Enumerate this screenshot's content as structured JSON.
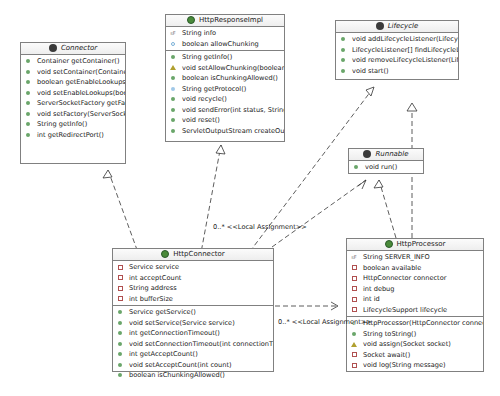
{
  "classes": {
    "connector": {
      "name": "Connector",
      "kind": "interface",
      "fields": [],
      "methods": [
        {
          "vis": "pub",
          "text": "Container getContainer()"
        },
        {
          "vis": "pub",
          "text": "void setContainer(Container co..."
        },
        {
          "vis": "pub",
          "text": "boolean getEnableLookups()"
        },
        {
          "vis": "pub",
          "text": "void setEnableLookups(boolean..."
        },
        {
          "vis": "pub",
          "text": "ServerSocketFactory getFactory()"
        },
        {
          "vis": "pub",
          "text": "void setFactory(ServerSocketF..."
        },
        {
          "vis": "pub",
          "text": "String getInfo()"
        },
        {
          "vis": "pub",
          "text": "int getRedirectPort()"
        }
      ]
    },
    "httpResponseImpl": {
      "name": "HttpResponseImpl",
      "kind": "class",
      "fields": [
        {
          "vis": "const",
          "text": "String info"
        },
        {
          "vis": "pkgfield",
          "text": "boolean allowChunking"
        }
      ],
      "methods": [
        {
          "vis": "pub",
          "text": "String getInfo()"
        },
        {
          "vis": "prot",
          "text": "void setAllowChunking(boolean allowChun..."
        },
        {
          "vis": "pub",
          "text": "boolean isChunkingAllowed()"
        },
        {
          "vis": "pkg",
          "text": "String getProtocol()"
        },
        {
          "vis": "pub",
          "text": "void recycle()"
        },
        {
          "vis": "pub",
          "text": "void sendError(int status, String message)"
        },
        {
          "vis": "pub",
          "text": "void reset()"
        },
        {
          "vis": "pub",
          "text": "ServletOutputStream createOutputStream()"
        }
      ]
    },
    "lifecycle": {
      "name": "Lifecycle",
      "kind": "interface",
      "fields": [],
      "methods": [
        {
          "vis": "pub",
          "text": "void addLifecycleListener(LifecycleListen..."
        },
        {
          "vis": "pub",
          "text": "LifecycleListener[] findLifecycleListeners()"
        },
        {
          "vis": "pub",
          "text": "void removeLifecycleListener(LifecycleLi..."
        },
        {
          "vis": "pub",
          "text": "void start()"
        }
      ]
    },
    "runnable": {
      "name": "Runnable",
      "kind": "interface",
      "fields": [],
      "methods": [
        {
          "vis": "pub",
          "text": "void run()"
        }
      ]
    },
    "httpConnector": {
      "name": "HttpConnector",
      "kind": "class",
      "fields": [
        {
          "vis": "priv",
          "text": "Service service"
        },
        {
          "vis": "priv",
          "text": "int acceptCount"
        },
        {
          "vis": "priv",
          "text": "String address"
        },
        {
          "vis": "priv",
          "text": "int bufferSize"
        }
      ],
      "methods": [
        {
          "vis": "pub",
          "text": "Service getService()"
        },
        {
          "vis": "pub",
          "text": "void setService(Service service)"
        },
        {
          "vis": "pub",
          "text": "int getConnectionTimeout()"
        },
        {
          "vis": "pub",
          "text": "void setConnectionTimeout(int connectionTim..."
        },
        {
          "vis": "pub",
          "text": "int getAcceptCount()"
        },
        {
          "vis": "pub",
          "text": "void setAcceptCount(int count)"
        },
        {
          "vis": "pub",
          "text": "boolean isChunkingAllowed()"
        }
      ]
    },
    "httpProcessor": {
      "name": "HttpProcessor",
      "kind": "class",
      "fields": [
        {
          "vis": "const",
          "text": "String SERVER_INFO"
        },
        {
          "vis": "priv",
          "text": "boolean available"
        },
        {
          "vis": "priv",
          "text": "HttpConnector connector"
        },
        {
          "vis": "priv",
          "text": "int debug"
        },
        {
          "vis": "priv",
          "text": "int id"
        },
        {
          "vis": "priv",
          "text": "LifecycleSupport lifecycle"
        }
      ],
      "methods": [
        {
          "vis": "ctor",
          "text": "HttpProcessor(HttpConnector connecto..."
        },
        {
          "vis": "pub",
          "text": "String toString()"
        },
        {
          "vis": "prot",
          "text": "void assign(Socket socket)"
        },
        {
          "vis": "priv",
          "text": "Socket await()"
        },
        {
          "vis": "priv",
          "text": "void log(String message)"
        }
      ]
    }
  },
  "relations": {
    "label1": "0..* <<Local Assignment>>",
    "label2": "0..* <<Local Assignment>>"
  }
}
